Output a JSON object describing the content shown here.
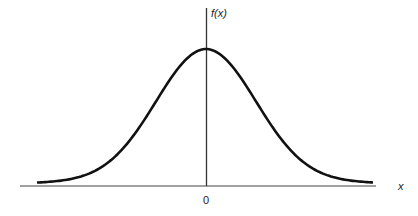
{
  "chart_data": {
    "type": "line",
    "title": "",
    "xlabel": "x",
    "ylabel": "f(x)",
    "x_tick_labels": [
      "0"
    ],
    "grid": false,
    "legend": null,
    "series": [
      {
        "name": "f(x) (normal / Gaussian density curve)",
        "mean": 0,
        "x": [
          -3.5,
          -3,
          -2.5,
          -2,
          -1.5,
          -1,
          -0.5,
          0,
          0.5,
          1,
          1.5,
          2,
          2.5,
          3,
          3.5
        ],
        "y_relative": [
          0.002,
          0.011,
          0.044,
          0.135,
          0.325,
          0.607,
          0.882,
          1.0,
          0.882,
          0.607,
          0.325,
          0.135,
          0.044,
          0.011,
          0.002
        ]
      }
    ],
    "annotations": []
  },
  "labels": {
    "y_axis": "f(x)",
    "x_axis": "x",
    "origin": "0"
  },
  "colors": {
    "curve": "#111111",
    "axes": "#333333",
    "background": "#ffffff"
  }
}
